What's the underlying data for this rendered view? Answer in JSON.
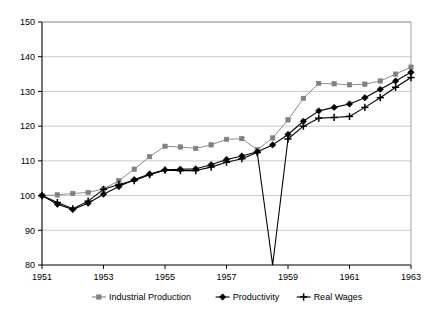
{
  "chart_data": {
    "type": "line",
    "title": "",
    "xlabel": "",
    "ylabel": "",
    "xlim": [
      1951,
      1963
    ],
    "ylim": [
      80,
      150
    ],
    "yticks": [
      80,
      90,
      100,
      110,
      120,
      130,
      140,
      150
    ],
    "xticks": [
      1951,
      1953,
      1955,
      1957,
      1959,
      1961,
      1963
    ],
    "xtick_labels": [
      "1951",
      "1953",
      "1955",
      "1957",
      "1959",
      "1961",
      "1963"
    ],
    "ytick_labels": [
      "80",
      "90",
      "100",
      "110",
      "120",
      "130",
      "140",
      "150"
    ],
    "grid": "horizontal",
    "legend_position": "bottom",
    "x": [
      1951,
      1951.5,
      1952,
      1952.5,
      1953,
      1953.5,
      1954,
      1954.5,
      1955,
      1955.5,
      1956,
      1956.5,
      1957,
      1957.5,
      1958,
      1958.5,
      1959,
      1959.5,
      1960,
      1960.5,
      1961,
      1961.5,
      1962,
      1962.5,
      1963
    ],
    "series": [
      {
        "name": "Industrial Production",
        "color": "#808080",
        "marker": "square",
        "values": [
          100.0,
          100.2,
          100.6,
          100.9,
          101.9,
          104.3,
          107.6,
          111.2,
          114.2,
          114.0,
          113.6,
          114.6,
          116.2,
          116.4,
          113.2,
          116.6,
          121.8,
          128.0,
          132.3,
          132.2,
          131.9,
          132.1,
          133.0,
          135.0,
          137.0
        ]
      },
      {
        "name": "Productivity",
        "color": "#000000",
        "marker": "diamond",
        "values": [
          100.0,
          97.5,
          96.0,
          97.8,
          100.4,
          102.6,
          104.6,
          106.2,
          107.4,
          107.6,
          107.7,
          108.9,
          110.4,
          111.4,
          112.6,
          114.6,
          117.6,
          121.4,
          124.4,
          125.4,
          126.4,
          128.2,
          130.6,
          133.0,
          135.5
        ]
      },
      {
        "name": "Real Wages",
        "color": "#000000",
        "marker": "plus",
        "values": [
          100.0,
          98.0,
          96.2,
          98.4,
          101.8,
          103.2,
          104.3,
          106.0,
          107.3,
          107.2,
          107.2,
          108.2,
          109.6,
          110.6,
          112.4,
          80.0,
          116.3,
          120.0,
          122.3,
          122.5,
          122.8,
          125.4,
          128.2,
          131.2,
          134.0
        ]
      }
    ],
    "annotations": [
      {
        "type": "vertical-drop",
        "series": "Real Wages",
        "x": 1958.5,
        "from": 112.4,
        "to": 80.0,
        "description": "Real Wages series drops vertically to the axis floor at 1958.5"
      }
    ]
  },
  "legend": {
    "items": [
      {
        "label": "Industrial Production",
        "color": "#808080",
        "marker": "square"
      },
      {
        "label": "Productivity",
        "color": "#000000",
        "marker": "diamond"
      },
      {
        "label": "Real Wages",
        "color": "#000000",
        "marker": "plus"
      }
    ]
  }
}
